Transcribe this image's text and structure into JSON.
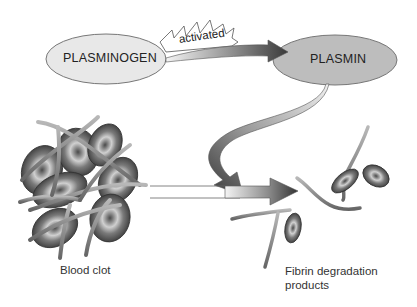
{
  "diagram": {
    "nodes": {
      "plasminogen": {
        "label": "PLASMINOGEN",
        "fill": "#e6e6e6"
      },
      "plasmin": {
        "label": "PLASMIN",
        "fill": "#bdbdbd"
      }
    },
    "activation_label": "activated",
    "captions": {
      "blood_clot": "Blood clot",
      "fibrin_products_line1": "Fibrin degradation",
      "fibrin_products_line2": "products"
    },
    "edges": [
      {
        "from": "PLASMINOGEN",
        "to": "PLASMIN",
        "label": "activated"
      },
      {
        "from": "PLASMIN",
        "to": "Blood clot → Fibrin degradation products",
        "label": ""
      },
      {
        "from": "Blood clot",
        "to": "Fibrin degradation products",
        "label": ""
      }
    ],
    "colors": {
      "arrow_dark": "#3a3a3a",
      "arrow_light": "#f2f2f2",
      "cell": "#6e6e6e",
      "fiber": "#8a8a8a"
    }
  }
}
